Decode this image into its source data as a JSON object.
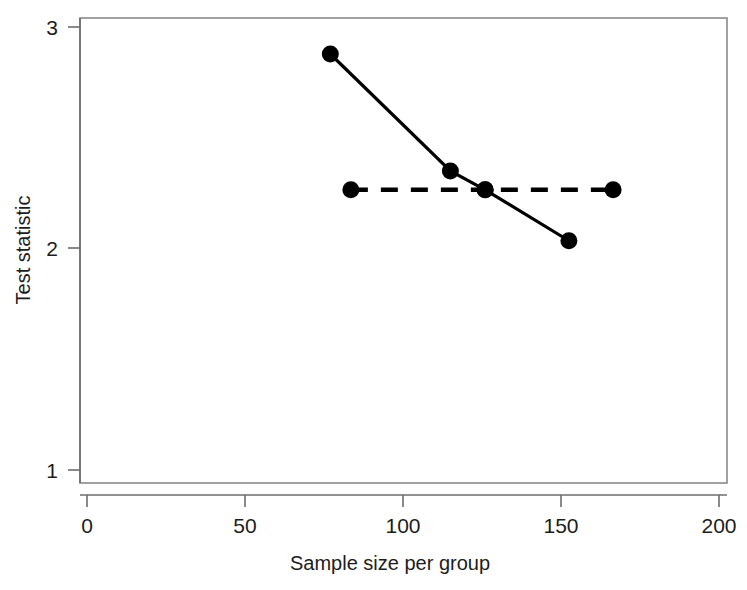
{
  "chart_data": {
    "type": "line",
    "title": "",
    "xlabel": "Sample size per group",
    "ylabel": "Test statistic",
    "xlim": [
      0,
      200
    ],
    "ylim": [
      1,
      3
    ],
    "xticks": [
      0,
      50,
      100,
      150,
      200
    ],
    "xtick_labels": [
      "0",
      "50",
      "100",
      "150",
      "200"
    ],
    "yticks": [
      1,
      2,
      3
    ],
    "ytick_labels": [
      "1",
      "2",
      "3"
    ],
    "grid": false,
    "legend": "none",
    "box": true,
    "series": [
      {
        "name": "solid-curve",
        "style": "solid",
        "marker": "filled-circle",
        "color": "#000000",
        "x": [
          77,
          115,
          126,
          152.5
        ],
        "y": [
          2.878,
          2.35,
          2.265,
          2.035
        ]
      },
      {
        "name": "dashed-reference",
        "style": "dashed",
        "marker": "filled-circle",
        "color": "#000000",
        "x": [
          83.5,
          126,
          166.5
        ],
        "y": [
          2.265,
          2.265,
          2.265
        ]
      }
    ]
  },
  "axis": {
    "x_title": "Sample size per group",
    "y_title": "Test statistic",
    "x_ticks": [
      {
        "value": 0,
        "label": "0"
      },
      {
        "value": 50,
        "label": "50"
      },
      {
        "value": 100,
        "label": "100"
      },
      {
        "value": 150,
        "label": "150"
      },
      {
        "value": 200,
        "label": "200"
      }
    ],
    "y_ticks": [
      {
        "value": 1,
        "label": "1"
      },
      {
        "value": 2,
        "label": "2"
      },
      {
        "value": 3,
        "label": "3"
      }
    ]
  },
  "colors": {
    "ink": "#1d1d1d",
    "axis": "#6d6d6d",
    "data": "#000000",
    "background": "#ffffff"
  }
}
